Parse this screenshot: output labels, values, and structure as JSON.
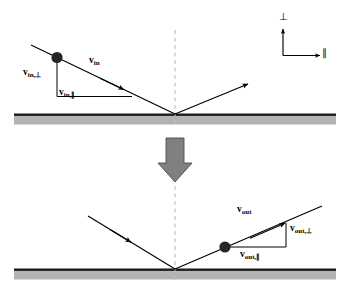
{
  "figure": {
    "colors": {
      "line": "#000000",
      "surface_line": "#1a1a1a",
      "surface_fill": "#b3b3b3",
      "normal_dash": "#bdbdbd",
      "block_arrow": "#808080",
      "block_arrow_edge": "#4d4d4d",
      "particle": "#262626",
      "background": "#ffffff"
    },
    "axes_legend": {
      "name": "component-axes-legend",
      "perpendicular_symbol": "⊥",
      "parallel_symbol": "∥"
    },
    "panels": [
      {
        "name": "incoming-panel",
        "position": "top",
        "surface_label": "surface",
        "normal_line": "dashed",
        "vectors": [
          {
            "name": "v-in",
            "label": "v",
            "subscript": "in"
          },
          {
            "name": "v-in-perp",
            "label": "v",
            "subscript": "in,⊥"
          },
          {
            "name": "v-in-parallel",
            "label": "v",
            "subscript": "in,∥"
          }
        ],
        "rays": [
          "incident-ray",
          "reflected-ray"
        ],
        "particle": "particle-dot"
      },
      {
        "name": "outgoing-panel",
        "position": "bottom",
        "surface_label": "surface",
        "normal_line": "dashed",
        "vectors": [
          {
            "name": "v-out",
            "label": "v",
            "subscript": "out"
          },
          {
            "name": "v-out-perp",
            "label": "v",
            "subscript": "out,⊥"
          },
          {
            "name": "v-out-parallel",
            "label": "v",
            "subscript": "out,∥"
          }
        ],
        "rays": [
          "incident-ray",
          "reflected-ray"
        ],
        "particle": "particle-dot"
      }
    ],
    "transition_arrow": {
      "name": "time-progression-arrow",
      "direction": "down"
    },
    "labels": {
      "v_in": "v",
      "v_in_sub": "in",
      "v_in_perp": "v",
      "v_in_perp_sub": "in,⊥",
      "v_in_par": "v",
      "v_in_par_sub": "in,∥",
      "v_out": "v",
      "v_out_sub": "out",
      "v_out_perp": "v",
      "v_out_perp_sub": "out,⊥",
      "v_out_par": "v",
      "v_out_par_sub": "out,∥",
      "perp_axis": "⊥",
      "par_axis": "∥"
    }
  }
}
